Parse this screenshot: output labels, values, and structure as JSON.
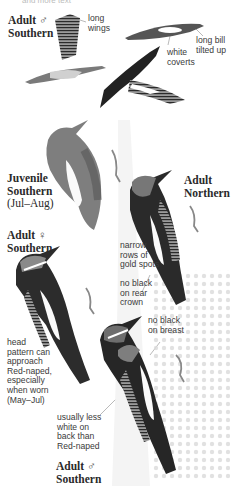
{
  "plate": {
    "top_cutoff_text": "and more text",
    "labels": [
      {
        "id": "adult-male-southern-top",
        "line1": "Adult",
        "symbol": "♂",
        "line2": "Southern"
      },
      {
        "id": "juvenile-southern",
        "line1": "Juvenile",
        "line2": "Southern",
        "sub": "(Jul–Aug)"
      },
      {
        "id": "adult-northern",
        "line1": "Adult",
        "line2": "Northern"
      },
      {
        "id": "adult-female-southern",
        "line1": "Adult",
        "symbol": "♀",
        "line2": "Southern"
      },
      {
        "id": "adult-male-southern-bottom",
        "line1": "Adult",
        "symbol": "♂",
        "line2": "Southern"
      }
    ],
    "annotations": [
      {
        "id": "long-wings",
        "text": "long\nwings"
      },
      {
        "id": "long-bill",
        "text": "long bill\ntilted up"
      },
      {
        "id": "white-coverts",
        "text": "white\ncoverts"
      },
      {
        "id": "gold-spots",
        "text": "narrow\nrows of\ngold spots"
      },
      {
        "id": "rear-crown",
        "text": "no black\non rear\ncrown"
      },
      {
        "id": "breast",
        "text": "no black\non breast"
      },
      {
        "id": "head-pattern",
        "text": "head\npattern can\napproach\nRed-naped,\nespecially\nwhen worn\n(May–Jul)"
      },
      {
        "id": "less-white",
        "text": "usually less\nwhite on\nback than\nRed-naped"
      }
    ]
  },
  "colors": {
    "background": "#ffffff",
    "plumage_dark": "#1e1e1e",
    "plumage_mid": "#6a6a6a",
    "plumage_light": "#bdbdbd",
    "leader_line": "#8a8a8a"
  }
}
